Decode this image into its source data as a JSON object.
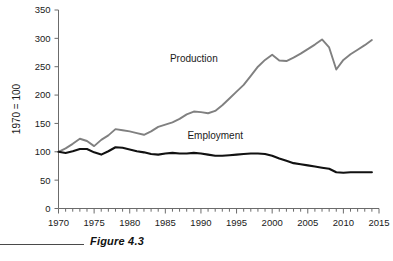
{
  "figure": {
    "caption": "Figure 4.3"
  },
  "chart_data": {
    "type": "line",
    "title": "",
    "subtitle": "",
    "xlabel": "",
    "ylabel": "1970 = 100",
    "xlim": [
      1970,
      2015
    ],
    "ylim": [
      0,
      350
    ],
    "grid": false,
    "legend_position": "inline-annotation",
    "y_ticks": [
      0,
      50,
      100,
      150,
      200,
      250,
      300,
      350
    ],
    "y_tick_labels": [
      "0",
      "50",
      "100",
      "150",
      "200",
      "250",
      "300",
      "350"
    ],
    "x_ticks": [
      1970,
      1975,
      1980,
      1985,
      1990,
      1995,
      2000,
      2005,
      2010,
      2015
    ],
    "x_tick_labels": [
      "1970",
      "1975",
      "1980",
      "1985",
      "1990",
      "1995",
      "2000",
      "2005",
      "2010",
      "2015"
    ],
    "x_minor_tick_interval": 1,
    "x": [
      1970,
      1971,
      1972,
      1973,
      1974,
      1975,
      1976,
      1977,
      1978,
      1979,
      1980,
      1981,
      1982,
      1983,
      1984,
      1985,
      1986,
      1987,
      1988,
      1989,
      1990,
      1991,
      1992,
      1993,
      1994,
      1995,
      1996,
      1997,
      1998,
      1999,
      2000,
      2001,
      2002,
      2003,
      2004,
      2005,
      2006,
      2007,
      2008,
      2009,
      2010,
      2011,
      2012,
      2013,
      2014
    ],
    "series": [
      {
        "name": "Production",
        "color": "#808080",
        "label_x": 1989,
        "label_y": 258,
        "values": [
          100,
          106,
          114,
          123,
          119,
          110,
          121,
          129,
          140,
          138,
          136,
          133,
          130,
          136,
          144,
          148,
          152,
          158,
          166,
          171,
          170,
          168,
          172,
          182,
          194,
          206,
          218,
          234,
          250,
          262,
          271,
          261,
          260,
          266,
          273,
          281,
          289,
          298,
          284,
          245,
          262,
          272,
          280,
          288,
          297
        ]
      },
      {
        "name": "Employment",
        "color": "#111111",
        "label_x": 1992,
        "label_y": 122,
        "values": [
          100,
          98,
          101,
          105,
          105,
          99,
          95,
          101,
          108,
          107,
          104,
          101,
          99,
          96,
          95,
          97,
          98,
          97,
          97,
          98,
          97,
          95,
          93,
          93,
          94,
          95,
          96,
          97,
          97,
          96,
          93,
          88,
          84,
          80,
          78,
          76,
          74,
          72,
          70,
          64,
          63,
          64,
          64,
          64,
          64
        ]
      }
    ]
  }
}
